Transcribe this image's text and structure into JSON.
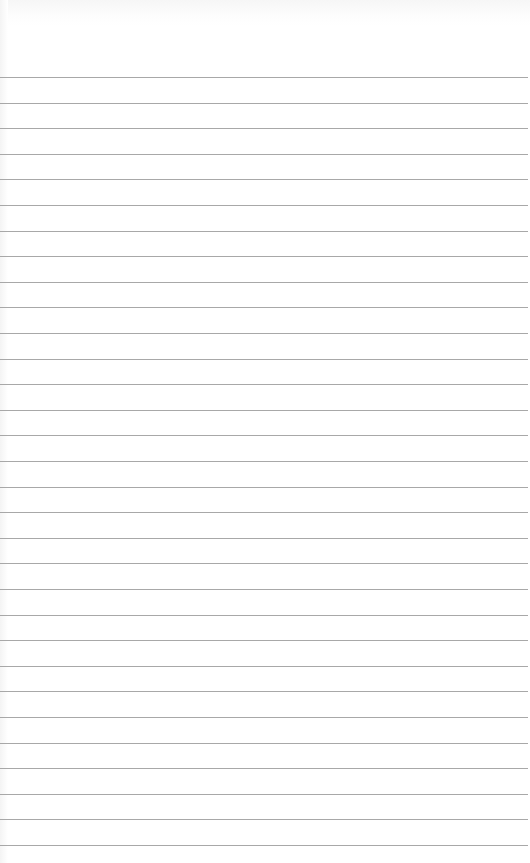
{
  "page": {
    "type": "lined-paper",
    "background_color": "#ffffff",
    "rule_color": "#a8a8a8",
    "first_rule_y": 77,
    "rule_spacing": 25.6,
    "rule_count": 31
  }
}
